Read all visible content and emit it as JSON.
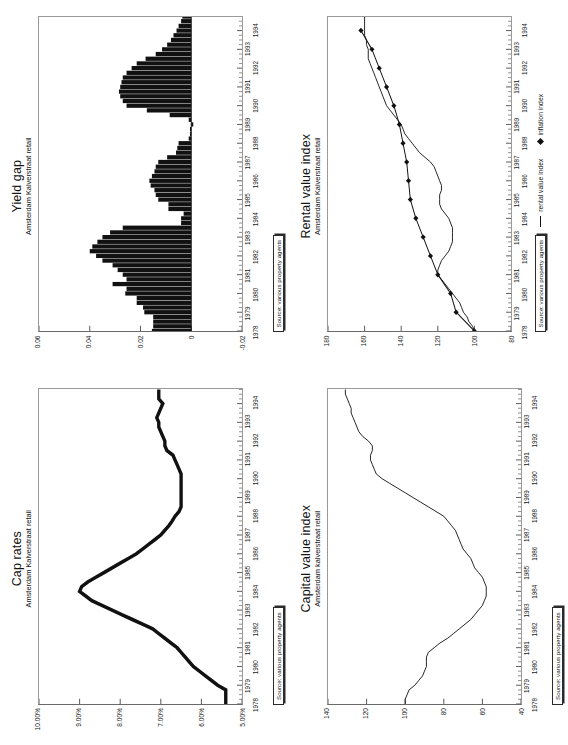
{
  "page": {
    "orientation": "rotated-90-ccw",
    "background": "#ffffff",
    "ink": "#111111"
  },
  "source_note": "Source: various property agents",
  "legend": {
    "rental_line_label": "rental value index",
    "inflation_marker_label": "inflation index",
    "line_icon": "line-swatch-icon",
    "diamond_icon": "diamond-marker-icon"
  },
  "charts": [
    {
      "id": "cap-rates",
      "title": "Cap rates",
      "subtitle": "Amsterdam Kalverstraat retail",
      "chart_data": {
        "type": "line",
        "title": "Cap rates",
        "subtitle": "Amsterdam Kalverstraat retail",
        "xlabel": "",
        "ylabel": "",
        "grid": false,
        "legend": "none",
        "ylim": [
          5,
          10
        ],
        "yticks": [
          5,
          6,
          7,
          8,
          9,
          10
        ],
        "ytick_labels": [
          "5.00%",
          "6.00%",
          "7.00%",
          "8.00%",
          "9.00%",
          "10.00%"
        ],
        "xlim": [
          1978,
          1994.75
        ],
        "xticks": [
          1978,
          1979,
          1980,
          1981,
          1982,
          1983,
          1984,
          1985,
          1986,
          1987,
          1988,
          1989,
          1990,
          1991,
          1992,
          1993,
          1994
        ],
        "xtick_labels": [
          "1978",
          "1979",
          "1980",
          "1981",
          "1982",
          "1983",
          "1984",
          "1985",
          "1986",
          "1987",
          "1988",
          "1989",
          "1990",
          "1991",
          "1992",
          "1993",
          "1994"
        ],
        "x": [
          1978.0,
          1978.25,
          1978.5,
          1978.75,
          1979.0,
          1979.25,
          1979.5,
          1979.75,
          1980.0,
          1980.25,
          1980.5,
          1980.75,
          1981.0,
          1981.25,
          1981.5,
          1981.75,
          1982.0,
          1982.25,
          1982.5,
          1982.75,
          1983.0,
          1983.25,
          1983.5,
          1983.75,
          1984.0,
          1984.25,
          1984.5,
          1984.75,
          1985.0,
          1985.25,
          1985.5,
          1985.75,
          1986.0,
          1986.25,
          1986.5,
          1986.75,
          1987.0,
          1987.25,
          1987.5,
          1987.75,
          1988.0,
          1988.25,
          1988.5,
          1988.75,
          1989.0,
          1989.25,
          1989.5,
          1989.75,
          1990.0,
          1990.25,
          1990.5,
          1990.75,
          1991.0,
          1991.25,
          1991.5,
          1991.75,
          1992.0,
          1992.25,
          1992.5,
          1992.75,
          1993.0,
          1993.25,
          1993.5,
          1993.75,
          1994.0,
          1994.25,
          1994.5,
          1994.75
        ],
        "values": [
          5.4,
          5.4,
          5.4,
          5.4,
          5.6,
          5.75,
          5.9,
          6.05,
          6.2,
          6.3,
          6.4,
          6.5,
          6.6,
          6.75,
          6.9,
          7.05,
          7.2,
          7.45,
          7.7,
          7.95,
          8.2,
          8.45,
          8.7,
          8.85,
          9.0,
          8.95,
          8.8,
          8.6,
          8.4,
          8.2,
          8.0,
          7.8,
          7.6,
          7.45,
          7.3,
          7.15,
          7.0,
          6.9,
          6.8,
          6.72,
          6.65,
          6.55,
          6.5,
          6.5,
          6.5,
          6.5,
          6.5,
          6.5,
          6.5,
          6.5,
          6.55,
          6.6,
          6.65,
          6.7,
          6.85,
          6.9,
          6.9,
          6.95,
          7.0,
          7.05,
          7.05,
          7.1,
          7.05,
          7.0,
          6.95,
          7.05,
          7.05,
          7.05
        ],
        "series_name": "cap rate"
      }
    },
    {
      "id": "yield-gap",
      "title": "Yield gap",
      "subtitle": "Amsterdam Kalverstraat retail",
      "chart_data": {
        "type": "bar",
        "title": "Yield gap",
        "subtitle": "Amsterdam Kalverstraat retail",
        "xlabel": "",
        "ylabel": "",
        "grid": false,
        "legend": "none",
        "ylim": [
          -0.02,
          0.06
        ],
        "yticks": [
          -0.02,
          0,
          0.02,
          0.04,
          0.06
        ],
        "ytick_labels": [
          "-0.02",
          "0",
          "0.02",
          "0.04",
          "0.06"
        ],
        "xlim": [
          1978,
          1994.75
        ],
        "xticks": [
          1978,
          1979,
          1980,
          1981,
          1982,
          1983,
          1984,
          1985,
          1986,
          1987,
          1988,
          1989,
          1990,
          1991,
          1992,
          1993,
          1994
        ],
        "xtick_labels": [
          "1978",
          "1979",
          "1980",
          "1981",
          "1982",
          "1983",
          "1984",
          "1985",
          "1986",
          "1987",
          "1988",
          "1989",
          "1990",
          "1991",
          "1992",
          "1993",
          "1994"
        ],
        "x": [
          1978.0,
          1978.25,
          1978.5,
          1978.75,
          1979.0,
          1979.25,
          1979.5,
          1979.75,
          1980.0,
          1980.25,
          1980.5,
          1980.75,
          1981.0,
          1981.25,
          1981.5,
          1981.75,
          1982.0,
          1982.25,
          1982.5,
          1982.75,
          1983.0,
          1983.25,
          1983.5,
          1983.75,
          1984.0,
          1984.25,
          1984.5,
          1984.75,
          1985.0,
          1985.25,
          1985.5,
          1985.75,
          1986.0,
          1986.25,
          1986.5,
          1986.75,
          1987.0,
          1987.25,
          1987.5,
          1987.75,
          1988.0,
          1988.25,
          1988.5,
          1988.75,
          1989.0,
          1989.25,
          1989.5,
          1989.75,
          1990.0,
          1990.25,
          1990.5,
          1990.75,
          1991.0,
          1991.25,
          1991.5,
          1991.75,
          1992.0,
          1992.25,
          1992.5,
          1992.75,
          1993.0,
          1993.25,
          1993.5,
          1993.75,
          1994.0,
          1994.25,
          1994.5,
          1994.75
        ],
        "values": [
          0.0155,
          0.015,
          0.015,
          0.015,
          0.0185,
          0.019,
          0.0215,
          0.0215,
          0.026,
          0.0255,
          0.031,
          0.0255,
          0.027,
          0.029,
          0.031,
          0.035,
          0.0375,
          0.04,
          0.039,
          0.037,
          0.035,
          0.032,
          0.027,
          0.004,
          0.004,
          0.003,
          0.009,
          0.009,
          0.013,
          0.014,
          0.0145,
          0.016,
          0.0165,
          0.0155,
          0.0145,
          0.014,
          0.013,
          0.0095,
          0.006,
          0.0055,
          0.005,
          0.001,
          0.0005,
          0.0005,
          -0.0008,
          0.001,
          0.0085,
          0.0175,
          0.0255,
          0.027,
          0.028,
          0.0285,
          0.028,
          0.0275,
          0.027,
          0.0255,
          0.0235,
          0.0215,
          0.018,
          0.014,
          0.0115,
          0.0095,
          0.008,
          0.007,
          0.0058,
          0.005,
          0.004,
          0.0035
        ],
        "series_name": "yield gap"
      }
    },
    {
      "id": "capital-value-index",
      "title": "Capital value index",
      "subtitle": "Amsterdam kalverstraat retail",
      "chart_data": {
        "type": "line",
        "title": "Capital value index",
        "subtitle": "Amsterdam kalverstraat retail",
        "xlabel": "",
        "ylabel": "",
        "grid": false,
        "legend": "none",
        "ylim": [
          40,
          140
        ],
        "yticks": [
          40,
          60,
          80,
          100,
          120,
          140
        ],
        "ytick_labels": [
          "40",
          "60",
          "80",
          "100",
          "120",
          "140"
        ],
        "xlim": [
          1978,
          1994.75
        ],
        "xticks": [
          1978,
          1979,
          1980,
          1981,
          1982,
          1983,
          1984,
          1985,
          1986,
          1987,
          1988,
          1989,
          1990,
          1991,
          1992,
          1993,
          1994
        ],
        "xtick_labels": [
          "1978",
          "1979",
          "1980",
          "1981",
          "1982",
          "1983",
          "1984",
          "1985",
          "1986",
          "1987",
          "1988",
          "1989",
          "1990",
          "1991",
          "1992",
          "1993",
          "1994"
        ],
        "x": [
          1978.0,
          1978.25,
          1978.5,
          1978.75,
          1979.0,
          1979.25,
          1979.5,
          1979.75,
          1980.0,
          1980.25,
          1980.5,
          1980.75,
          1981.0,
          1981.25,
          1981.5,
          1981.75,
          1982.0,
          1982.25,
          1982.5,
          1982.75,
          1983.0,
          1983.25,
          1983.5,
          1983.75,
          1984.0,
          1984.25,
          1984.5,
          1984.75,
          1985.0,
          1985.25,
          1985.5,
          1985.75,
          1986.0,
          1986.25,
          1986.5,
          1986.75,
          1987.0,
          1987.25,
          1987.5,
          1987.75,
          1988.0,
          1988.25,
          1988.5,
          1988.75,
          1989.0,
          1989.25,
          1989.5,
          1989.75,
          1990.0,
          1990.25,
          1990.5,
          1990.75,
          1991.0,
          1991.25,
          1991.5,
          1991.75,
          1992.0,
          1992.25,
          1992.5,
          1992.75,
          1993.0,
          1993.25,
          1993.5,
          1993.75,
          1994.0,
          1994.25,
          1994.5,
          1994.75
        ],
        "values": [
          100,
          100,
          99,
          98,
          95,
          93,
          91,
          90,
          89,
          89,
          89,
          88,
          85,
          82,
          78,
          75,
          72,
          69,
          66,
          64,
          62,
          60,
          59,
          58,
          58,
          58,
          59,
          60,
          62,
          64,
          65,
          66,
          68,
          70,
          71,
          72,
          73,
          74,
          76,
          78,
          80,
          84,
          88,
          92,
          96,
          100,
          104,
          108,
          112,
          115,
          116,
          117,
          118,
          118,
          117,
          117,
          119,
          122,
          124,
          125,
          126,
          127,
          128,
          128,
          129,
          130,
          131,
          131
        ],
        "series_name": "capital value index"
      }
    },
    {
      "id": "rental-value-index",
      "title": "Rental value index",
      "subtitle": "Amsterdam Kalverstraat retail",
      "chart_data": {
        "type": "line",
        "title": "Rental value index",
        "subtitle": "Amsterdam Kalverstraat retail",
        "xlabel": "",
        "ylabel": "",
        "grid": false,
        "legend": "bottom",
        "ylim": [
          80,
          180
        ],
        "yticks": [
          80,
          100,
          120,
          140,
          160,
          180
        ],
        "ytick_labels": [
          "80",
          "100",
          "120",
          "140",
          "160",
          "180"
        ],
        "xlim": [
          1978,
          1994.75
        ],
        "xticks": [
          1978,
          1979,
          1980,
          1981,
          1982,
          1983,
          1984,
          1985,
          1986,
          1987,
          1988,
          1989,
          1990,
          1991,
          1992,
          1993,
          1994
        ],
        "xtick_labels": [
          "1978",
          "1979",
          "1980",
          "1981",
          "1982",
          "1983",
          "1984",
          "1985",
          "1986",
          "1987",
          "1988",
          "1989",
          "1990",
          "1991",
          "1992",
          "1993",
          "1994"
        ],
        "series": [
          {
            "name": "rental value index",
            "style": "line",
            "x": [
              1978.0,
              1978.25,
              1978.5,
              1978.75,
              1979.0,
              1979.25,
              1979.5,
              1979.75,
              1980.0,
              1980.25,
              1980.5,
              1980.75,
              1981.0,
              1981.25,
              1981.5,
              1981.75,
              1982.0,
              1982.25,
              1982.5,
              1982.75,
              1983.0,
              1983.25,
              1983.5,
              1983.75,
              1984.0,
              1984.25,
              1984.5,
              1984.75,
              1985.0,
              1985.25,
              1985.5,
              1985.75,
              1986.0,
              1986.25,
              1986.5,
              1986.75,
              1987.0,
              1987.25,
              1987.5,
              1987.75,
              1988.0,
              1988.25,
              1988.5,
              1988.75,
              1989.0,
              1989.25,
              1989.5,
              1989.75,
              1990.0,
              1990.25,
              1990.5,
              1990.75,
              1991.0,
              1991.25,
              1991.5,
              1991.75,
              1992.0,
              1992.25,
              1992.5,
              1992.75,
              1993.0,
              1993.25,
              1993.5,
              1993.75,
              1994.0,
              1994.25,
              1994.5,
              1994.75
            ],
            "values": [
              100,
              101,
              103,
              104,
              106,
              107,
              108,
              110,
              112,
              114,
              116,
              118,
              120,
              120,
              119,
              118,
              116,
              114,
              113,
              112,
              112,
              112,
              112,
              113,
              114,
              116,
              118,
              119,
              119,
              119,
              118,
              118,
              119,
              120,
              121,
              122,
              124,
              127,
              130,
              132,
              134,
              136,
              138,
              139,
              140,
              142,
              144,
              146,
              148,
              149,
              150,
              151,
              152,
              153,
              154,
              155,
              156,
              157,
              158,
              158,
              158,
              159,
              159,
              160,
              160,
              160,
              160,
              160
            ]
          },
          {
            "name": "inflation index",
            "style": "line-with-diamond-markers",
            "x": [
              1978,
              1979,
              1980,
              1981,
              1982,
              1983,
              1984,
              1985,
              1986,
              1987,
              1988,
              1989,
              1990,
              1991,
              1992,
              1993,
              1994
            ],
            "values": [
              100,
              110,
              113,
              120,
              124,
              128,
              132,
              135,
              136,
              137,
              139,
              141,
              144,
              148,
              152,
              156,
              162
            ]
          }
        ]
      }
    }
  ]
}
